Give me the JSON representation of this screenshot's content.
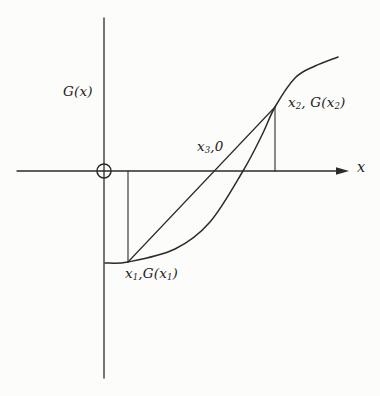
{
  "figure": {
    "labels": {
      "y_axis_title": "G(x)",
      "x_axis_title": "x",
      "secant_root": {
        "v": "x",
        "sub": "3",
        "rest": ",0"
      },
      "point_upper": {
        "v": "x",
        "sub": "2",
        "mid": ", G(x",
        "sub2": "2",
        "rest": ")"
      },
      "point_lower": {
        "v": "x",
        "sub": "1",
        "mid": ",G(x",
        "sub2": "1",
        "rest": ")"
      }
    },
    "colors": {
      "stroke": "#2b2b2b",
      "background": "#fcfcfa",
      "text": "#1c1c1c"
    },
    "geometry": {
      "canvas": {
        "w": 380,
        "h": 396
      },
      "x_axis": {
        "x1": 17,
        "y1": 171,
        "x2": 337,
        "y2": 171,
        "arrow_tip_x": 349,
        "arrow_half_width": 3.8,
        "arrow_length": 13
      },
      "y_axis": {
        "x": 104,
        "y1": 18,
        "y2": 378
      },
      "origin_circle": {
        "cx": 104,
        "cy": 171,
        "r": 7
      },
      "curve_points": [
        [
          105,
          263
        ],
        [
          128,
          262
        ],
        [
          175,
          249
        ],
        [
          210,
          222
        ],
        [
          243,
          171
        ],
        [
          262,
          135
        ],
        [
          275,
          107
        ],
        [
          295,
          78
        ],
        [
          315,
          66
        ],
        [
          338,
          57
        ]
      ],
      "secant": {
        "x1": 128,
        "y1": 262,
        "x2": 275,
        "y2": 107
      },
      "drop_lines": [
        {
          "x1": 128,
          "y1": 171,
          "x2": 128,
          "y2": 262
        },
        {
          "x1": 275,
          "y1": 107,
          "x2": 275,
          "y2": 171
        }
      ]
    }
  }
}
